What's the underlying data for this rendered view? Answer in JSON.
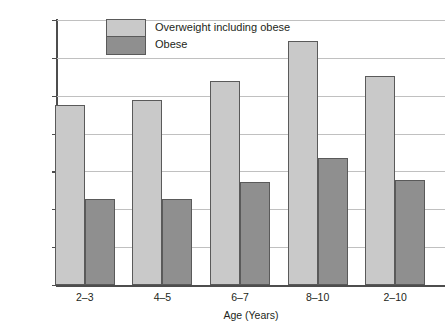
{
  "chart_data": {
    "type": "bar",
    "title": "",
    "xlabel": "Age (Years)",
    "ylabel": "Percentage",
    "categories": [
      "2–3",
      "4–5",
      "6–7",
      "8–10",
      "2–10"
    ],
    "series": [
      {
        "name": "Overweight including obese",
        "color": "#c9c9c9",
        "values": [
          23.8,
          24.5,
          27.0,
          32.2,
          27.6
        ]
      },
      {
        "name": "Obese",
        "color": "#8f8f8f",
        "values": [
          11.4,
          11.4,
          13.6,
          16.8,
          13.9
        ]
      }
    ],
    "ylim": [
      0,
      35
    ],
    "ytick_values": [
      0,
      5,
      10,
      15,
      20,
      25,
      30,
      35
    ],
    "ytick_labels": [
      "0",
      "5",
      "10",
      "15",
      "20",
      "25",
      "30",
      "35"
    ],
    "grid": "horizontal",
    "legend_position": "top-left-inside"
  }
}
